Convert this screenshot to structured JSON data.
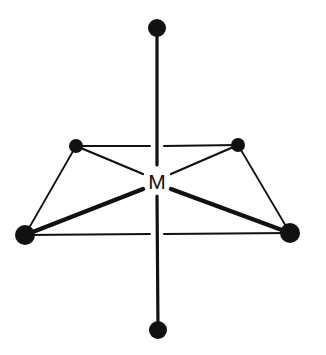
{
  "diagram": {
    "type": "octahedral-geometry",
    "center_label": "M",
    "colors": {
      "stroke": "#111111",
      "background": "#ffffff"
    },
    "center": {
      "x": 157,
      "y": 181
    },
    "atoms": [
      {
        "id": "axial-top",
        "x": 157,
        "y": 28,
        "r": 9
      },
      {
        "id": "axial-bottom",
        "x": 158,
        "y": 330,
        "r": 9
      },
      {
        "id": "equatorial-back-left",
        "x": 76,
        "y": 146,
        "r": 7
      },
      {
        "id": "equatorial-back-right",
        "x": 238,
        "y": 145,
        "r": 7
      },
      {
        "id": "equatorial-front-left",
        "x": 25,
        "y": 235,
        "r": 10
      },
      {
        "id": "equatorial-front-right",
        "x": 290,
        "y": 233,
        "r": 10
      }
    ]
  }
}
